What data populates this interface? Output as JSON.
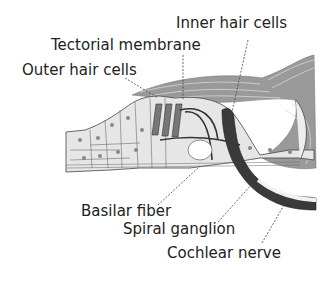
{
  "diagram": {
    "labels": {
      "inner_hair_cells": "Inner hair cells",
      "tectorial_membrane": "Tectorial membrane",
      "outer_hair_cells": "Outer hair cells",
      "basilar_fiber": "Basilar fiber",
      "spiral_ganglion": "Spiral ganglion",
      "cochlear_nerve": "Cochlear nerve"
    },
    "colors": {
      "tissue_fill": "#e6e6e6",
      "membrane_fill": "#9a9a9a",
      "nerve_fill": "#3a3a3a",
      "outline": "#444444",
      "text": "#222222"
    }
  }
}
